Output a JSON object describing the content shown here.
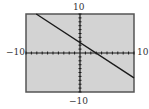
{
  "chart_data": {
    "type": "line",
    "title": "",
    "xlabel": "",
    "ylabel": "",
    "xlim": [
      -10,
      10
    ],
    "ylim": [
      -10,
      10
    ],
    "xscale_ticks": 1,
    "yscale_ticks": 1,
    "grid": false,
    "axis_labels": {
      "ymax": "10",
      "ymin": "−10",
      "xmin": "−10",
      "xmax": "10"
    },
    "series": [
      {
        "name": "line",
        "x": [
          -8.1,
          10
        ],
        "y": [
          10,
          -6.4
        ],
        "approx_equation": "y ≈ -0.9x + 2.7"
      }
    ]
  },
  "colors": {
    "plot_background": "#d3d3d3",
    "border": "#555555",
    "axes": "#1a1a1a",
    "line": "#1a1a1a"
  }
}
